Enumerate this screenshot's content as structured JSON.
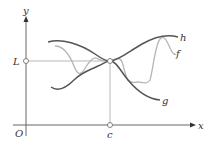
{
  "diagram": {
    "axes": {
      "x_label": "x",
      "y_label": "y",
      "origin_label": "O"
    },
    "points": {
      "limit_label": "L",
      "c_label": "c"
    },
    "curves": [
      {
        "name": "h",
        "label": "h",
        "color": "#555555",
        "role": "upper bound"
      },
      {
        "name": "f",
        "label": "f",
        "color": "#b5b5b5",
        "role": "squeezed function"
      },
      {
        "name": "g",
        "label": "g",
        "color": "#555555",
        "role": "lower bound"
      }
    ],
    "colors": {
      "axis": "#666666",
      "guide": "#999999",
      "bound_curve": "#555555",
      "squeezed_curve": "#b5b5b5"
    }
  }
}
